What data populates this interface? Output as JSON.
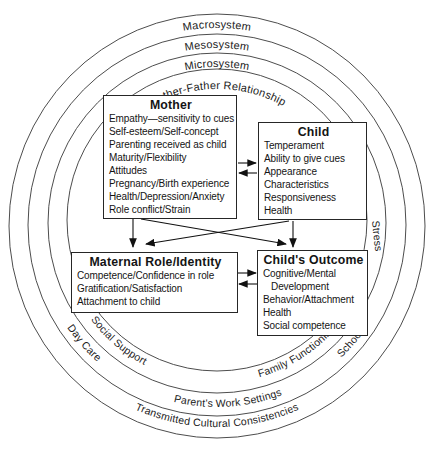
{
  "diagram": {
    "rings": {
      "macrosystem": "Macrosystem",
      "mesosystem": "Mesosystem",
      "microsystem": "Microsystem",
      "mother_father_relationship": "Mother-Father Relationship",
      "day_care": "Day Care",
      "social_support": "Social Support",
      "family_functioning": "Family Functioning",
      "school": "School",
      "stress": "Stress",
      "parents_work_settings": "Parent's Work Settings",
      "transmitted_cultural_consistencies": "Transmitted Cultural Consistencies"
    },
    "boxes": {
      "mother": {
        "title": "Mother",
        "items": [
          "Empathy—sensitivity to cues",
          "Self-esteem/Self-concept",
          "Parenting received as child",
          "Maturity/Flexibility",
          "Attitudes",
          "Pregnancy/Birth experience",
          "Health/Depression/Anxiety",
          "Role conflict/Strain"
        ]
      },
      "child": {
        "title": "Child",
        "items": [
          "Temperament",
          "Ability to give cues",
          "Appearance",
          "Characteristics",
          "Responsiveness",
          "Health"
        ]
      },
      "maternal_role": {
        "title": "Maternal Role/Identity",
        "items": [
          "Competence/Confidence in role",
          "Gratification/Satisfaction",
          "Attachment to child"
        ]
      },
      "childs_outcome": {
        "title": "Child's Outcome",
        "items": [
          "Cognitive/Mental",
          "   Development",
          "Behavior/Attachment",
          "Health",
          "Social competence"
        ]
      }
    },
    "colors": {
      "background": "#ffffff",
      "ring_line": "#4d4d4d",
      "text": "#1c1c1c",
      "box_border": "#262626",
      "arrow": "#111111"
    }
  }
}
